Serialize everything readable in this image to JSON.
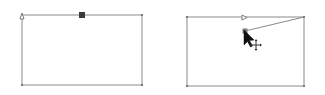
{
  "diagram": {
    "colors": {
      "background": "#ffffff",
      "stroke": "#8a8a8a",
      "anchor": "#7a7a7a",
      "selected_anchor": "#3a3a3a",
      "cursor": "#111111"
    },
    "panels": [
      {
        "id": "before",
        "rect": {
          "x": 22,
          "y": 15,
          "w": 120,
          "h": 70
        },
        "start_marker": {
          "x": 22,
          "y": 15,
          "icon": "triangle-start-marker"
        },
        "selected_anchor": {
          "x": 82,
          "y": 15,
          "icon": "filled-square-anchor"
        },
        "corner_anchors": [
          [
            142,
            15
          ],
          [
            22,
            85
          ],
          [
            142,
            85
          ]
        ]
      },
      {
        "id": "after",
        "rect": {
          "x": 187,
          "y": 17,
          "w": 117,
          "h": 69
        },
        "direction_marker": {
          "x": 245,
          "y": 17,
          "icon": "arrow-direction-marker"
        },
        "dragged_segment": {
          "from": [
            304,
            17
          ],
          "to": [
            245,
            31
          ]
        },
        "dragged_anchor": {
          "x": 245,
          "y": 31,
          "icon": "square-anchor"
        },
        "corner_anchors": [
          [
            187,
            17
          ],
          [
            304,
            17
          ],
          [
            187,
            86
          ],
          [
            304,
            86
          ]
        ],
        "cursor": {
          "x": 244,
          "y": 30,
          "icon": "arrow-pointer-cursor"
        },
        "move_indicator": {
          "x": 256,
          "y": 45,
          "icon": "move-crosshair-icon"
        }
      }
    ]
  }
}
